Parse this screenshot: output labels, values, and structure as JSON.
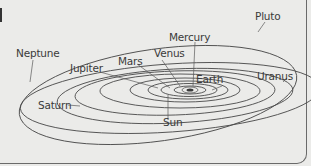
{
  "diagram": {
    "center_body": "Sun",
    "labels": [
      {
        "id": "pluto",
        "text": "Pluto"
      },
      {
        "id": "mercury",
        "text": "Mercury"
      },
      {
        "id": "neptune",
        "text": "Neptune"
      },
      {
        "id": "venus",
        "text": "Venus"
      },
      {
        "id": "mars",
        "text": "Mars"
      },
      {
        "id": "jupiter",
        "text": "Jupiter"
      },
      {
        "id": "earth",
        "text": "Earth"
      },
      {
        "id": "uranus",
        "text": "Uranus"
      },
      {
        "id": "saturn",
        "text": "Saturn"
      },
      {
        "id": "sun",
        "text": "Sun"
      }
    ],
    "colors": {
      "background": "#ebebe9",
      "line": "#4a4a4a",
      "text": "#3a3a3a"
    }
  }
}
